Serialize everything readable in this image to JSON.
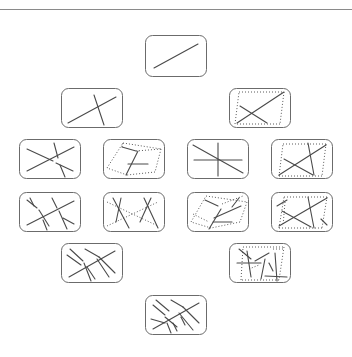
{
  "diagram": {
    "colors": {
      "frame": "#6b6b6b",
      "line": "#4a4a4a",
      "dotted": "#5a5a5a",
      "background": "#ffffff",
      "separator": "#8a8a8a"
    },
    "panels": [
      {
        "id": "r1c1",
        "x": 145,
        "y": 35,
        "w": 62,
        "h": 42,
        "solid": [
          [
            9,
            33,
            53,
            9
          ]
        ],
        "dotted": []
      },
      {
        "id": "r2c1",
        "x": 61,
        "y": 88,
        "w": 62,
        "h": 40,
        "solid": [
          [
            7,
            35,
            55,
            9
          ],
          [
            33,
            7,
            43,
            37
          ]
        ],
        "dotted": []
      },
      {
        "id": "r2c2",
        "x": 229,
        "y": 88,
        "w": 62,
        "h": 40,
        "solid": [
          [
            8,
            35,
            55,
            4
          ],
          [
            11,
            18,
            38,
            35
          ]
        ],
        "dotted": [
          [
            10,
            4,
            55,
            4
          ],
          [
            55,
            4,
            51,
            36
          ],
          [
            51,
            36,
            6,
            36
          ],
          [
            6,
            36,
            10,
            4
          ]
        ]
      },
      {
        "id": "r3c1",
        "x": 19,
        "y": 139,
        "w": 62,
        "h": 40,
        "solid": [
          [
            8,
            10,
            34,
            22
          ],
          [
            37,
            24,
            54,
            32
          ],
          [
            8,
            32,
            55,
            8
          ],
          [
            35,
            4,
            39,
            19
          ],
          [
            41,
            26,
            46,
            38
          ]
        ],
        "dotted": []
      },
      {
        "id": "r3c2",
        "x": 103,
        "y": 139,
        "w": 62,
        "h": 40,
        "solid": [
          [
            19,
            8,
            33,
            12
          ],
          [
            35,
            12,
            23,
            36
          ],
          [
            25,
            25,
            45,
            25
          ]
        ],
        "dotted": [
          [
            20,
            4,
            58,
            10
          ],
          [
            58,
            10,
            52,
            33
          ],
          [
            52,
            33,
            24,
            36
          ],
          [
            24,
            36,
            4,
            29
          ],
          [
            4,
            29,
            20,
            4
          ],
          [
            20,
            4,
            19,
            8
          ],
          [
            33,
            12,
            58,
            10
          ]
        ]
      },
      {
        "id": "r3c3",
        "x": 187,
        "y": 139,
        "w": 62,
        "h": 40,
        "solid": [
          [
            7,
            21,
            55,
            21
          ],
          [
            31,
            4,
            31,
            37
          ],
          [
            6,
            6,
            56,
            34
          ]
        ],
        "dotted": []
      },
      {
        "id": "r3c4",
        "x": 271,
        "y": 139,
        "w": 62,
        "h": 40,
        "solid": [
          [
            8,
            36,
            55,
            6
          ],
          [
            13,
            20,
            42,
            36
          ],
          [
            37,
            4,
            43,
            36
          ]
        ],
        "dotted": [
          [
            12,
            5,
            55,
            5
          ],
          [
            55,
            5,
            51,
            37
          ],
          [
            51,
            37,
            8,
            37
          ],
          [
            8,
            37,
            12,
            5
          ]
        ]
      },
      {
        "id": "r4c1",
        "x": 19,
        "y": 192,
        "w": 62,
        "h": 40,
        "solid": [
          [
            8,
            8,
            18,
            16
          ],
          [
            20,
            18,
            30,
            34
          ],
          [
            11,
            6,
            15,
            14
          ],
          [
            33,
            6,
            38,
            16
          ],
          [
            40,
            19,
            48,
            37
          ],
          [
            44,
            26,
            55,
            32
          ],
          [
            8,
            33,
            55,
            9
          ],
          [
            24,
            28,
            28,
            38
          ]
        ],
        "dotted": []
      },
      {
        "id": "r4c2",
        "x": 103,
        "y": 192,
        "w": 62,
        "h": 40,
        "solid": [
          [
            10,
            6,
            26,
            36
          ],
          [
            13,
            30,
            18,
            6
          ],
          [
            41,
            6,
            55,
            36
          ],
          [
            37,
            30,
            48,
            6
          ]
        ],
        "dotted": [
          [
            4,
            10,
            55,
            34
          ],
          [
            4,
            34,
            55,
            10
          ]
        ]
      },
      {
        "id": "r4c3",
        "x": 187,
        "y": 192,
        "w": 62,
        "h": 40,
        "solid": [
          [
            18,
            8,
            31,
            14
          ],
          [
            34,
            17,
            22,
            37
          ],
          [
            27,
            26,
            54,
            14
          ],
          [
            26,
            30,
            45,
            30
          ],
          [
            52,
            6,
            45,
            15
          ]
        ],
        "dotted": [
          [
            19,
            4,
            60,
            10
          ],
          [
            60,
            10,
            53,
            30
          ],
          [
            53,
            30,
            24,
            36
          ],
          [
            24,
            36,
            4,
            30
          ],
          [
            4,
            30,
            19,
            4
          ],
          [
            6,
            22,
            22,
            30
          ],
          [
            35,
            12,
            56,
            4
          ]
        ]
      },
      {
        "id": "r4c4",
        "x": 271,
        "y": 192,
        "w": 62,
        "h": 40,
        "solid": [
          [
            8,
            34,
            56,
            6
          ],
          [
            11,
            19,
            40,
            35
          ],
          [
            37,
            5,
            43,
            36
          ],
          [
            6,
            14,
            16,
            8
          ],
          [
            50,
            27,
            56,
            33
          ]
        ],
        "dotted": [
          [
            13,
            5,
            56,
            5
          ],
          [
            56,
            5,
            51,
            36
          ],
          [
            51,
            36,
            8,
            36
          ],
          [
            8,
            36,
            13,
            5
          ],
          [
            14,
            10,
            12,
            34
          ]
        ]
      },
      {
        "id": "r5c1",
        "x": 61,
        "y": 243,
        "w": 62,
        "h": 40,
        "solid": [
          [
            6,
            12,
            20,
            22
          ],
          [
            9,
            6,
            22,
            18
          ],
          [
            23,
            20,
            30,
            38
          ],
          [
            26,
            24,
            34,
            36
          ],
          [
            24,
            6,
            38,
            14
          ],
          [
            38,
            14,
            54,
            30
          ],
          [
            36,
            16,
            48,
            34
          ],
          [
            8,
            34,
            54,
            8
          ]
        ],
        "dotted": []
      },
      {
        "id": "r5c2",
        "x": 229,
        "y": 243,
        "w": 62,
        "h": 40,
        "solid": [
          [
            10,
            6,
            22,
            16
          ],
          [
            18,
            8,
            22,
            34
          ],
          [
            8,
            20,
            32,
            20
          ],
          [
            26,
            18,
            40,
            10
          ],
          [
            32,
            36,
            36,
            16
          ],
          [
            40,
            20,
            44,
            28
          ],
          [
            46,
            10,
            48,
            38
          ],
          [
            36,
            33,
            58,
            34
          ]
        ],
        "dotted": [
          [
            14,
            4,
            55,
            4
          ],
          [
            55,
            4,
            50,
            37
          ],
          [
            50,
            37,
            12,
            37
          ],
          [
            12,
            37,
            14,
            4
          ],
          [
            20,
            26,
            30,
            22
          ],
          [
            44,
            6,
            54,
            6
          ]
        ]
      },
      {
        "id": "r6c1",
        "x": 145,
        "y": 295,
        "w": 62,
        "h": 40,
        "solid": [
          [
            8,
            10,
            20,
            20
          ],
          [
            11,
            5,
            24,
            16
          ],
          [
            20,
            22,
            32,
            32
          ],
          [
            6,
            24,
            20,
            28
          ],
          [
            22,
            28,
            26,
            38
          ],
          [
            28,
            28,
            32,
            36
          ],
          [
            26,
            5,
            38,
            12
          ],
          [
            38,
            12,
            54,
            28
          ],
          [
            34,
            18,
            48,
            35
          ],
          [
            8,
            34,
            54,
            8
          ],
          [
            36,
            22,
            40,
            30
          ]
        ],
        "dotted": []
      }
    ]
  }
}
